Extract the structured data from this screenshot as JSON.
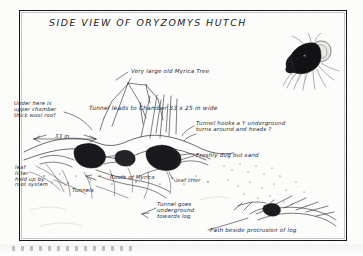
{
  "document": {
    "kind": "field-notebook-sketch",
    "title": "SIDE VIEW OF ORYZOMYS HUTCH",
    "ink_color": "#26262c",
    "paper_color": "#fcfcfb",
    "frame_color": "#15161a"
  },
  "annotations": {
    "myrica_tree": "Very large old Myrica Tree",
    "upper_chamber": "Under here is\nupper chamber\nthick wool roof",
    "tunnel_to_chamber": "Tunnel leads to Chamber  33 x 25 in wide",
    "tunnel_hooks": "Tunnel hooks a Y underground\n      turns around  and heads ?",
    "width_measure": "33 in",
    "fresh_sand": "Freshly dug out sand",
    "leaf_litter": "leaf\nlitter\nheld up by\nroot system",
    "roots_of_myrica": "Roots of Myrica",
    "leaf_litter_2": "leaf litter",
    "tunnels": "Tunnels",
    "tunnel_goes": "Tunnel goes\nunderground\ntowards log",
    "path_beside_log": "Path beside protrusion of log"
  },
  "inset": {
    "subject": "oryzomys-head-photo",
    "description": "dark rodent head in profile with whiskers"
  },
  "measurements": {
    "chamber_width_in": 33,
    "chamber_depth_in": 25,
    "burrow_span_in": 33
  }
}
